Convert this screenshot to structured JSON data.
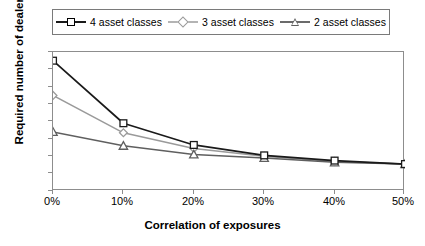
{
  "chart_data": {
    "type": "line",
    "title": "",
    "xlabel": "Correlation of exposures",
    "ylabel": "Required number of dealers",
    "x": [
      0,
      10,
      20,
      30,
      40,
      50
    ],
    "xtick_labels": [
      "0%",
      "10%",
      "20%",
      "30%",
      "40%",
      "50%"
    ],
    "ytick_labels": [
      "0",
      "2",
      "4",
      "6",
      "8",
      "10",
      "12",
      "14",
      "16"
    ],
    "xlim": [
      0,
      50
    ],
    "ylim": [
      0,
      16
    ],
    "ystep": 2,
    "grid": false,
    "legend_position": "top",
    "series": [
      {
        "name": "4 asset classes",
        "marker": "square",
        "color": "#1a1a1a",
        "values": [
          15.0,
          7.8,
          5.3,
          4.1,
          3.5,
          3.1
        ]
      },
      {
        "name": "3 asset classes",
        "marker": "diamond",
        "color": "#9a9a9a",
        "values": [
          11.0,
          6.7,
          4.9,
          4.0,
          3.4,
          3.1
        ]
      },
      {
        "name": "2 asset classes",
        "marker": "triangle",
        "color": "#5f5f5f",
        "values": [
          6.8,
          5.2,
          4.2,
          3.8,
          3.3,
          3.1
        ]
      }
    ]
  },
  "legend": {
    "items": [
      {
        "label": "4 asset classes"
      },
      {
        "label": "3 asset classes"
      },
      {
        "label": "2 asset classes"
      }
    ]
  },
  "axes": {
    "y_title": "Required number of dealers",
    "x_title": "Correlation of exposures",
    "y_ticks": [
      "16",
      "14",
      "12",
      "10",
      "8",
      "6",
      "4",
      "2",
      "0"
    ],
    "x_ticks": [
      "0%",
      "10%",
      "20%",
      "30%",
      "40%",
      "50%"
    ]
  },
  "colors": {
    "series_4": "#1a1a1a",
    "series_3": "#9a9a9a",
    "series_2": "#5f5f5f",
    "axis": "#8d8d8d",
    "background": "#ffffff"
  }
}
